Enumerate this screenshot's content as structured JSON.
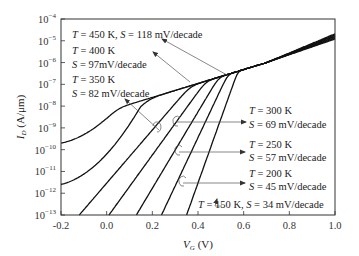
{
  "chart_data": {
    "type": "line",
    "title": "",
    "xlabel": "V_G (V)",
    "ylabel": "I_D (A/μm)",
    "xlim": [
      -0.2,
      1.0
    ],
    "ylim_log10": [
      -13,
      -4
    ],
    "yscale": "log",
    "grid": false,
    "legend": "inline annotations with arrows",
    "x_ticks": [
      "-0.2",
      "0.0",
      "0.2",
      "0.4",
      "0.6",
      "0.8",
      "1.0"
    ],
    "y_ticks": [
      "10^-4",
      "10^-5",
      "10^-6",
      "10^-7",
      "10^-8",
      "10^-9",
      "10^-10",
      "10^-11",
      "10^-12",
      "10^-13"
    ],
    "series": [
      {
        "name": "T = 450 K",
        "T_K": 450,
        "S_mV_per_decade": 118,
        "floor_log10": -9.7,
        "x_at_bottom": null,
        "I_at_1V_log10": -4.68
      },
      {
        "name": "T = 400 K",
        "T_K": 400,
        "S_mV_per_decade": 97,
        "floor_log10": -11.6,
        "x_at_bottom": null,
        "I_at_1V_log10": -4.72
      },
      {
        "name": "T = 350 K",
        "T_K": 350,
        "S_mV_per_decade": 82,
        "floor_log10": null,
        "x_at_bottom": -0.12,
        "I_at_1V_log10": -4.76
      },
      {
        "name": "T = 300 K",
        "T_K": 300,
        "S_mV_per_decade": 69,
        "floor_log10": null,
        "x_at_bottom": 0.01,
        "I_at_1V_log10": -4.8
      },
      {
        "name": "T = 250 K",
        "T_K": 250,
        "S_mV_per_decade": 57,
        "floor_log10": null,
        "x_at_bottom": 0.13,
        "I_at_1V_log10": -4.84
      },
      {
        "name": "T = 200 K",
        "T_K": 200,
        "S_mV_per_decade": 45,
        "floor_log10": null,
        "x_at_bottom": 0.24,
        "I_at_1V_log10": -4.88
      },
      {
        "name": "T = 150 K",
        "T_K": 150,
        "S_mV_per_decade": 34,
        "floor_log10": null,
        "x_at_bottom": 0.35,
        "I_at_1V_log10": -4.92
      }
    ],
    "crossover_point": {
      "V_G": 0.7,
      "I_D_log10": -6.0
    }
  },
  "annotations": {
    "t450": {
      "T": "T",
      "eq1": " = 450 K, ",
      "S": "S",
      "eq2": " = 118 mV/decade"
    },
    "t400_line1": {
      "T": "T",
      "eq": " = 400 K"
    },
    "t400_line2": {
      "S": "S",
      "eq": " = 97mV/decade"
    },
    "t350_line1": {
      "T": "T",
      "eq": " = 350 K"
    },
    "t350_line2": {
      "S": "S",
      "eq": " = 82 mV/decade"
    },
    "t300_line1": {
      "T": "T",
      "eq": " = 300 K"
    },
    "t300_line2": {
      "S": "S",
      "eq": " = 69 mV/decade"
    },
    "t250_line1": {
      "T": "T",
      "eq": " = 250 K"
    },
    "t250_line2": {
      "S": "S",
      "eq": " = 57 mV/decade"
    },
    "t200_line1": {
      "T": "T",
      "eq": " = 200 K"
    },
    "t200_line2": {
      "S": "S",
      "eq": " = 45 mV/decade"
    },
    "t150": {
      "T": "T",
      "eq1": " = 150 K, ",
      "S": "S",
      "eq2": " = 34 mV/decade"
    }
  },
  "axis": {
    "x_label_main": "V",
    "x_label_sub": "G",
    "x_label_unit": " (V)",
    "y_label_main": "I",
    "y_label_sub": "D",
    "y_label_unit": " (A/μm)",
    "y_tick_base": "10",
    "y_tick_exps": [
      "−4",
      "−5",
      "−6",
      "−7",
      "−8",
      "−9",
      "−10",
      "−11",
      "−12",
      "−13"
    ]
  },
  "colors": {
    "curve": "#111111",
    "frame": "#333333",
    "arrow": "#555555",
    "text": "#222222"
  }
}
